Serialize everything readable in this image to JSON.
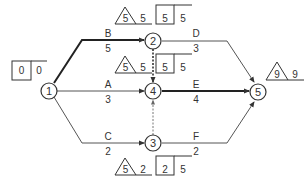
{
  "diagram": {
    "type": "activity-on-arrow network (CPM)",
    "colors": {
      "line": "#333333",
      "light_line": "#555555",
      "dashed": "#666666",
      "background": "#ffffff"
    },
    "nodes": [
      {
        "id": "1",
        "label": "1"
      },
      {
        "id": "2",
        "label": "2"
      },
      {
        "id": "3",
        "label": "3"
      },
      {
        "id": "4",
        "label": "4"
      },
      {
        "id": "5",
        "label": "5"
      }
    ],
    "activities": [
      {
        "name": "B",
        "duration": "5",
        "from": "1",
        "to": "2",
        "critical": true
      },
      {
        "name": "A",
        "duration": "3",
        "from": "1",
        "to": "4",
        "critical": false
      },
      {
        "name": "C",
        "duration": "2",
        "from": "1",
        "to": "3",
        "critical": false
      },
      {
        "name": "D",
        "duration": "3",
        "from": "2",
        "to": "5",
        "critical": false
      },
      {
        "name": "E",
        "duration": "4",
        "from": "4",
        "to": "5",
        "critical": true
      },
      {
        "name": "F",
        "duration": "2",
        "from": "3",
        "to": "5",
        "critical": false
      }
    ],
    "dummies": [
      {
        "from": "2",
        "to": "4",
        "critical": true
      },
      {
        "from": "3",
        "to": "4",
        "critical": false
      }
    ],
    "annotations": {
      "node1": {
        "box_value": "0",
        "box_side": "0"
      },
      "node2": {
        "triangle_value": "5",
        "triangle_side": "5",
        "box_value": "5",
        "box_side": "5"
      },
      "node4": {
        "triangle_value": "5",
        "triangle_side": "5",
        "box_value": "5",
        "box_side": "5"
      },
      "node3": {
        "triangle_value": "5",
        "triangle_side": "2",
        "box_value": "2",
        "box_side": "5"
      },
      "node5": {
        "triangle_value": "9",
        "triangle_side": "9"
      }
    }
  }
}
